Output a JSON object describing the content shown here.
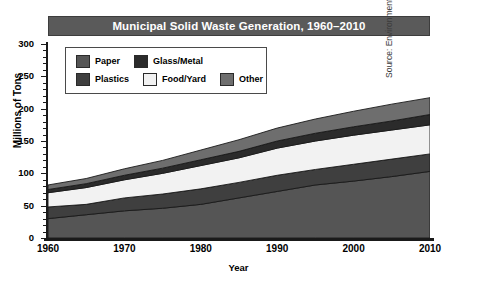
{
  "title": "Municipal Solid Waste Generation, 1960–2010",
  "source_note": "Source: Environmental Protection Agency",
  "legend": {
    "rows": [
      [
        {
          "label": "Paper",
          "color": "#555555"
        },
        {
          "label": "Glass/Metal",
          "color": "#2b2b2b"
        }
      ],
      [
        {
          "label": "Plastics",
          "color": "#3f3f3f"
        },
        {
          "label": "Food/Yard",
          "color": "#f2f2f2"
        },
        {
          "label": "Other",
          "color": "#6e6e6e"
        }
      ]
    ]
  },
  "chart_data": {
    "type": "area",
    "stacked": true,
    "title": "Municipal Solid Waste Generation, 1960–2010",
    "xlabel": "Year",
    "ylabel": "Millions of Tons",
    "xlim": [
      1960,
      2010
    ],
    "ylim": [
      0,
      300
    ],
    "yticks": [
      0,
      50,
      100,
      150,
      200,
      250,
      300
    ],
    "ytick_labels": [
      "0",
      "50",
      "100",
      "150",
      "200",
      "250",
      "300"
    ],
    "yminor_step": 10,
    "xticks": [
      1960,
      1970,
      1980,
      1990,
      2000,
      2010
    ],
    "xtick_labels": [
      "1960",
      "1970",
      "1980",
      "1990",
      "2000",
      "2010"
    ],
    "grid": false,
    "legend_position": "upper-left-inside",
    "x": [
      1960,
      1965,
      1970,
      1975,
      1980,
      1985,
      1990,
      1995,
      2000,
      2005,
      2010
    ],
    "series": [
      {
        "name": "Paper",
        "color": "#555555",
        "values": [
          30,
          36,
          42,
          46,
          52,
          62,
          72,
          82,
          88,
          95,
          103
        ]
      },
      {
        "name": "Plastics",
        "color": "#3f3f3f",
        "values": [
          18,
          16,
          20,
          22,
          24,
          24,
          25,
          24,
          26,
          27,
          27
        ]
      },
      {
        "name": "Food/Yard",
        "color": "#f2f2f2",
        "values": [
          22,
          26,
          28,
          32,
          36,
          38,
          42,
          44,
          45,
          45,
          45
        ]
      },
      {
        "name": "Glass/Metal",
        "color": "#2b2b2b",
        "values": [
          5,
          6,
          7,
          8,
          9,
          10,
          11,
          12,
          13,
          14,
          16
        ]
      },
      {
        "name": "Other",
        "color": "#6e6e6e",
        "values": [
          7,
          8,
          10,
          12,
          15,
          18,
          20,
          22,
          24,
          26,
          26
        ]
      }
    ],
    "totals": [
      82,
      92,
      107,
      120,
      136,
      152,
      170,
      184,
      196,
      207,
      217
    ],
    "annotations": []
  }
}
